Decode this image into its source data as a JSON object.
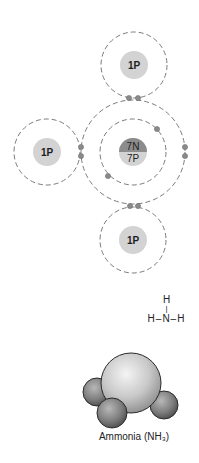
{
  "diagram": {
    "type": "bohr-covalent-bond-model",
    "colors": {
      "shell_stroke": "#7a7a7a",
      "proton": "#d3d3d3",
      "neutron": "#8c8c8c",
      "electron": "#8a8a8a",
      "text": "#1e1e1e"
    },
    "atoms": [
      {
        "id": "h-top",
        "label": "1P",
        "cx": 134,
        "cy": 65,
        "shell_r": 33,
        "nucleus_r": 14
      },
      {
        "id": "h-left",
        "label": "1P",
        "cx": 47,
        "cy": 152,
        "shell_r": 33,
        "nucleus_r": 14
      },
      {
        "id": "h-bottom",
        "label": "1P",
        "cx": 133,
        "cy": 240,
        "shell_r": 33,
        "nucleus_r": 14
      },
      {
        "id": "n-center",
        "label_top": "7N",
        "label_bottom": "7P",
        "cx": 133,
        "cy": 152,
        "inner_shell_r": 33,
        "outer_shell_r": 52,
        "nucleus_r": 14
      }
    ],
    "electrons": [
      {
        "x": 129,
        "y": 98
      },
      {
        "x": 138,
        "y": 98
      },
      {
        "x": 81,
        "y": 147
      },
      {
        "x": 81,
        "y": 156
      },
      {
        "x": 185,
        "y": 147
      },
      {
        "x": 185,
        "y": 156
      },
      {
        "x": 130,
        "y": 206
      },
      {
        "x": 138,
        "y": 206
      },
      {
        "x": 157,
        "y": 129
      },
      {
        "x": 108,
        "y": 176
      }
    ]
  },
  "structural_formula": {
    "top": "H",
    "bond": "|",
    "row": "H–N–H"
  },
  "molecule_model": {
    "caption": "Ammonia (NH₃)"
  }
}
